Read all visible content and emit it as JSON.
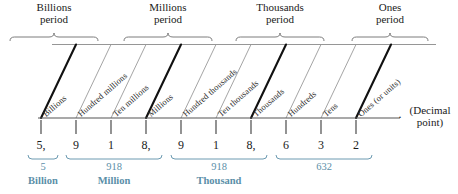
{
  "diagram": {
    "accent_color": "#5b8fa8",
    "ink_color": "#1a1a1a",
    "gray_color": "#8a8a8a",
    "periods": [
      {
        "name": "Billions",
        "line2": "period",
        "x": 10,
        "w": 88
      },
      {
        "name": "Millions",
        "line2": "period",
        "x": 124,
        "w": 88
      },
      {
        "name": "Thousands",
        "line2": "period",
        "x": 236,
        "w": 88
      },
      {
        "name": "Ones",
        "line2": "period",
        "x": 352,
        "w": 76
      }
    ],
    "columns": [
      {
        "label": "Billions",
        "digit": "5,",
        "thick": true,
        "x": 41
      },
      {
        "label": "Hundred millions",
        "digit": "9",
        "thick": false,
        "x": 76
      },
      {
        "label": "Ten millions",
        "digit": "1",
        "thick": false,
        "x": 111
      },
      {
        "label": "Millions",
        "digit": "8,",
        "thick": true,
        "x": 146
      },
      {
        "label": "Hundred thousands",
        "digit": "9",
        "thick": false,
        "x": 181
      },
      {
        "label": "Ten thousands",
        "digit": "1",
        "thick": false,
        "x": 216
      },
      {
        "label": "Thousands",
        "digit": "8,",
        "thick": true,
        "x": 251
      },
      {
        "label": "Hundreds",
        "digit": "6",
        "thick": false,
        "x": 286
      },
      {
        "label": "Tens",
        "digit": "3",
        "thick": false,
        "x": 321
      },
      {
        "label": "Ones (or units)",
        "digit": "2",
        "thick": true,
        "x": 356
      }
    ],
    "groups": [
      {
        "number": "5",
        "word": "Billion",
        "x0": 28,
        "x1": 58
      },
      {
        "number": "918",
        "word": "Million",
        "x0": 66,
        "x1": 162
      },
      {
        "number": "918",
        "word": "Thousand",
        "x0": 171,
        "x1": 267
      },
      {
        "number": "632",
        "word": "",
        "x0": 276,
        "x1": 372
      }
    ],
    "decimal": {
      "dot": ".",
      "note": "(Decimal\npoint)"
    }
  }
}
